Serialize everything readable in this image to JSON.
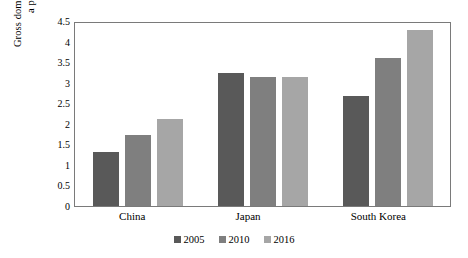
{
  "chart_data": {
    "type": "bar",
    "title": "",
    "subtitle": "",
    "xlabel": "",
    "ylabel": "Gross domestic expenditure on R & D as a percentage of GDP (%)",
    "ylabel_lines": [
      "Gross domestic expenditure on R & D as",
      "a percentage of GDP (%)"
    ],
    "categories": [
      "China",
      "Japan",
      "South Korea"
    ],
    "series": [
      {
        "name": "2005",
        "color": "#595959",
        "values": [
          1.32,
          3.24,
          2.68
        ]
      },
      {
        "name": "2010",
        "color": "#7f7f7f",
        "values": [
          1.73,
          3.14,
          3.59
        ]
      },
      {
        "name": "2016",
        "color": "#a6a6a6",
        "values": [
          2.12,
          3.15,
          4.29
        ]
      }
    ],
    "ylim": [
      0,
      4.5
    ],
    "ytick_step": 0.5,
    "yticks": [
      "4.5",
      "4",
      "3.5",
      "3",
      "2.5",
      "2",
      "1.5",
      "1",
      "0.5",
      "0"
    ],
    "ytick_values": [
      4.5,
      4,
      3.5,
      3,
      2.5,
      2,
      1.5,
      1,
      0.5,
      0
    ],
    "grid": false,
    "legend_position": "bottom",
    "plot_border": true,
    "border_color": "#7a7a7a",
    "background": "#ffffff"
  }
}
